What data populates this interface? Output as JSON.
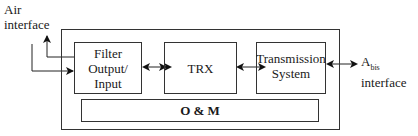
{
  "labels": {
    "air_interface": [
      "Air",
      "interface"
    ],
    "abis_main": "A",
    "abis_sub": "bis",
    "abis_interface": "interface"
  },
  "blocks": {
    "filter": [
      "Filter",
      "Output/",
      "Input"
    ],
    "trx": "TRX",
    "transmission": [
      "Transmission",
      "System"
    ],
    "om": "O & M"
  }
}
